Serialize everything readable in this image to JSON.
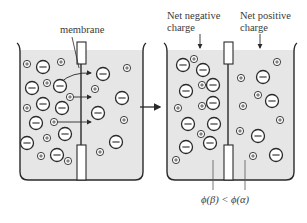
{
  "diagram": {
    "type": "membrane-ion-transport",
    "arrow_meaning": "before -> after",
    "left_panel": {
      "label": "membrane",
      "description": "Ions diffusing through membrane",
      "ions_left": [
        {
          "x": 27,
          "y": 64,
          "sign": "+"
        },
        {
          "x": 43,
          "y": 67,
          "sign": "-"
        },
        {
          "x": 61,
          "y": 62,
          "sign": "+"
        },
        {
          "x": 32,
          "y": 88,
          "sign": "-"
        },
        {
          "x": 47,
          "y": 83,
          "sign": "+"
        },
        {
          "x": 60,
          "y": 86,
          "sign": "-"
        },
        {
          "x": 70,
          "y": 97,
          "sign": "+"
        },
        {
          "x": 27,
          "y": 108,
          "sign": "+"
        },
        {
          "x": 43,
          "y": 104,
          "sign": "-"
        },
        {
          "x": 62,
          "y": 108,
          "sign": "-"
        },
        {
          "x": 36,
          "y": 123,
          "sign": "-"
        },
        {
          "x": 54,
          "y": 122,
          "sign": "+"
        },
        {
          "x": 65,
          "y": 134,
          "sign": "-"
        },
        {
          "x": 27,
          "y": 143,
          "sign": "-"
        },
        {
          "x": 47,
          "y": 138,
          "sign": "+"
        },
        {
          "x": 57,
          "y": 155,
          "sign": "-"
        },
        {
          "x": 41,
          "y": 156,
          "sign": "+"
        },
        {
          "x": 68,
          "y": 161,
          "sign": "+"
        }
      ],
      "ions_right": [
        {
          "x": 103,
          "y": 74,
          "sign": "-"
        },
        {
          "x": 127,
          "y": 68,
          "sign": "+"
        },
        {
          "x": 95,
          "y": 89,
          "sign": "+"
        },
        {
          "x": 122,
          "y": 98,
          "sign": "-"
        },
        {
          "x": 98,
          "y": 113,
          "sign": "-"
        },
        {
          "x": 124,
          "y": 120,
          "sign": "+"
        },
        {
          "x": 116,
          "y": 142,
          "sign": "-"
        },
        {
          "x": 100,
          "y": 152,
          "sign": "+"
        }
      ],
      "arrows": [
        {
          "from": [
            61,
            72
          ],
          "to": [
            93,
            75
          ],
          "curved": true
        },
        {
          "from": [
            73,
            97
          ],
          "to": [
            93,
            97
          ],
          "curved": false
        },
        {
          "from": [
            57,
            122
          ],
          "to": [
            93,
            122
          ],
          "curved": false
        }
      ]
    },
    "right_panel": {
      "label_left": "Net negative charge",
      "label_left_line1": "Net negative",
      "label_left_line2": "charge",
      "label_right": "Net positive charge",
      "label_right_line1": "Net positive",
      "label_right_line2": "charge",
      "ions_left": [
        {
          "x": 183,
          "y": 65,
          "sign": "-"
        },
        {
          "x": 194,
          "y": 59,
          "sign": "+"
        },
        {
          "x": 203,
          "y": 70,
          "sign": "-"
        },
        {
          "x": 186,
          "y": 91,
          "sign": "-"
        },
        {
          "x": 202,
          "y": 85,
          "sign": "+"
        },
        {
          "x": 213,
          "y": 85,
          "sign": "-"
        },
        {
          "x": 178,
          "y": 108,
          "sign": "+"
        },
        {
          "x": 202,
          "y": 106,
          "sign": "+"
        },
        {
          "x": 213,
          "y": 103,
          "sign": "-"
        },
        {
          "x": 188,
          "y": 124,
          "sign": "-"
        },
        {
          "x": 214,
          "y": 124,
          "sign": "-"
        },
        {
          "x": 201,
          "y": 134,
          "sign": "+"
        },
        {
          "x": 186,
          "y": 147,
          "sign": "-"
        },
        {
          "x": 210,
          "y": 143,
          "sign": "-"
        },
        {
          "x": 176,
          "y": 160,
          "sign": "+"
        }
      ],
      "ions_right": [
        {
          "x": 277,
          "y": 62,
          "sign": "+"
        },
        {
          "x": 263,
          "y": 77,
          "sign": "-"
        },
        {
          "x": 241,
          "y": 78,
          "sign": "+"
        },
        {
          "x": 258,
          "y": 95,
          "sign": "+"
        },
        {
          "x": 272,
          "y": 101,
          "sign": "-"
        },
        {
          "x": 243,
          "y": 106,
          "sign": "+"
        },
        {
          "x": 280,
          "y": 120,
          "sign": "+"
        },
        {
          "x": 240,
          "y": 131,
          "sign": "+"
        },
        {
          "x": 258,
          "y": 136,
          "sign": "-"
        },
        {
          "x": 253,
          "y": 156,
          "sign": "+"
        },
        {
          "x": 276,
          "y": 155,
          "sign": "-"
        }
      ],
      "inequality": "ϕ(β) < ϕ(α)"
    },
    "colors": {
      "fluid": "#e6e6e6",
      "outline": "#2a2a2a",
      "text": "#3a3a3a"
    }
  }
}
